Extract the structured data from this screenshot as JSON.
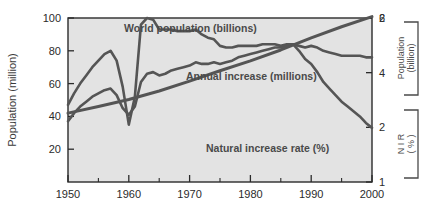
{
  "figure": {
    "background": "#ffffff",
    "plot_background": "#e3e3e3",
    "frame_color": "#2b2b2b",
    "line_color": "#555555"
  },
  "axes": {
    "left": {
      "title": "Population (million)",
      "ticks": [
        "20",
        "40",
        "60",
        "80",
        "100"
      ],
      "min": 0,
      "max": 100
    },
    "bottom": {
      "ticks": [
        "1950",
        "1960",
        "1970",
        "1980",
        "1990",
        "2000"
      ],
      "min": 1950,
      "max": 2000
    },
    "right_top": {
      "title_line1": "Population",
      "title_line2": "(billion)",
      "ticks": [
        "2",
        "4",
        "6"
      ],
      "min": 0,
      "max": 6
    },
    "right_bottom": {
      "title_line1": "N I R",
      "title_line2": "( % )",
      "ticks": [
        "1",
        "2"
      ],
      "min": 1,
      "max": 2
    }
  },
  "labels": {
    "world_population": "World population (billions)",
    "annual_increase": "Annual increase (millions)",
    "natural_increase_rate": "Natural increase rate (%)"
  },
  "chart_data": {
    "type": "line",
    "title": "",
    "xlabel": "",
    "ylabel": "Population (million)",
    "xlim": [
      1950,
      2000
    ],
    "ylim": [
      0,
      100
    ],
    "grid": false,
    "legend": "inline-annotations",
    "series": [
      {
        "name": "World population (billions)",
        "axis": "right_top",
        "unit": "billion",
        "x": [
          1950,
          1955,
          1960,
          1965,
          1970,
          1975,
          1980,
          1985,
          1990,
          1995,
          2000
        ],
        "values": [
          2.52,
          2.76,
          3.02,
          3.33,
          3.69,
          4.07,
          4.43,
          4.83,
          5.27,
          5.68,
          6.05
        ]
      },
      {
        "name": "Annual increase (millions)",
        "axis": "left",
        "unit": "million",
        "x": [
          1950,
          1951,
          1952,
          1953,
          1954,
          1955,
          1956,
          1957,
          1958,
          1959,
          1960,
          1961,
          1962,
          1963,
          1964,
          1965,
          1966,
          1967,
          1968,
          1969,
          1970,
          1971,
          1972,
          1973,
          1974,
          1975,
          1976,
          1977,
          1978,
          1979,
          1980,
          1981,
          1982,
          1983,
          1984,
          1985,
          1986,
          1987,
          1988,
          1989,
          1990,
          1991,
          1992,
          1993,
          1994,
          1995,
          1996,
          1997,
          1998,
          1999,
          2000
        ],
        "values": [
          37,
          42,
          46,
          49,
          52,
          54,
          56,
          57,
          53,
          45,
          41,
          46,
          61,
          66,
          67,
          65,
          66,
          68,
          69,
          70,
          71,
          73,
          72,
          72,
          73,
          72,
          73,
          74,
          76,
          77,
          78,
          79,
          80,
          81,
          82,
          82,
          83,
          84,
          83,
          82,
          83,
          82,
          80,
          79,
          78,
          77,
          77,
          77,
          77,
          76,
          76
        ]
      },
      {
        "name": "Natural increase rate (%)",
        "axis": "right_bottom",
        "unit": "%",
        "x": [
          1950,
          1951,
          1952,
          1953,
          1954,
          1955,
          1956,
          1957,
          1958,
          1959,
          1960,
          1961,
          1962,
          1963,
          1964,
          1965,
          1966,
          1967,
          1968,
          1969,
          1970,
          1971,
          1972,
          1973,
          1974,
          1975,
          1976,
          1977,
          1978,
          1979,
          1980,
          1981,
          1982,
          1983,
          1984,
          1985,
          1986,
          1987,
          1988,
          1989,
          1990,
          1991,
          1992,
          1993,
          1994,
          1995,
          1996,
          1997,
          1998,
          1999,
          2000
        ],
        "values": [
          1.47,
          1.54,
          1.6,
          1.65,
          1.7,
          1.74,
          1.78,
          1.8,
          1.74,
          1.58,
          1.35,
          1.52,
          1.96,
          2.0,
          1.99,
          1.93,
          1.93,
          1.93,
          1.92,
          1.92,
          1.92,
          1.93,
          1.9,
          1.88,
          1.87,
          1.83,
          1.82,
          1.82,
          1.83,
          1.83,
          1.83,
          1.83,
          1.84,
          1.84,
          1.84,
          1.83,
          1.84,
          1.84,
          1.8,
          1.75,
          1.72,
          1.67,
          1.61,
          1.57,
          1.53,
          1.49,
          1.46,
          1.43,
          1.4,
          1.36,
          1.33
        ]
      }
    ]
  }
}
